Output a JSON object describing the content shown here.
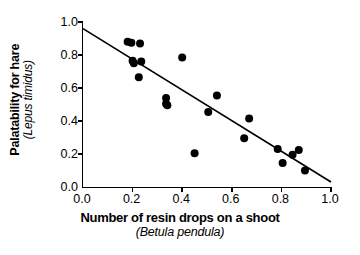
{
  "chart_data": {
    "type": "scatter",
    "title": "",
    "xlabel": "Number of resin drops on a shoot",
    "xlabel_sub": "(Betula pendula)",
    "ylabel": "Palatability for hare",
    "ylabel_sub": "(Lepus timidus)",
    "xlim": [
      0.0,
      1.0
    ],
    "ylim": [
      0.0,
      1.0
    ],
    "grid": false,
    "legend": "none",
    "xticks": [
      "0.0",
      "0.2",
      "0.4",
      "0.6",
      "0.8",
      "1.0"
    ],
    "xtick_values": [
      0.0,
      0.2,
      0.4,
      0.6,
      0.8,
      1.0
    ],
    "yticks": [
      "0.0",
      "0.2",
      "0.4",
      "0.6",
      "0.8",
      "1.0"
    ],
    "ytick_values": [
      0.0,
      0.2,
      0.4,
      0.6,
      0.8,
      1.0
    ],
    "marker": "filled-circle",
    "marker_color": "#000000",
    "marker_size_px": 8,
    "points": [
      {
        "x": 0.18,
        "y": 0.88
      },
      {
        "x": 0.195,
        "y": 0.875
      },
      {
        "x": 0.23,
        "y": 0.87
      },
      {
        "x": 0.2,
        "y": 0.765
      },
      {
        "x": 0.205,
        "y": 0.75
      },
      {
        "x": 0.235,
        "y": 0.76
      },
      {
        "x": 0.225,
        "y": 0.665
      },
      {
        "x": 0.335,
        "y": 0.54
      },
      {
        "x": 0.335,
        "y": 0.505
      },
      {
        "x": 0.34,
        "y": 0.495
      },
      {
        "x": 0.4,
        "y": 0.785
      },
      {
        "x": 0.45,
        "y": 0.205
      },
      {
        "x": 0.505,
        "y": 0.455
      },
      {
        "x": 0.54,
        "y": 0.555
      },
      {
        "x": 0.65,
        "y": 0.295
      },
      {
        "x": 0.67,
        "y": 0.415
      },
      {
        "x": 0.785,
        "y": 0.23
      },
      {
        "x": 0.805,
        "y": 0.145
      },
      {
        "x": 0.845,
        "y": 0.195
      },
      {
        "x": 0.87,
        "y": 0.225
      },
      {
        "x": 0.895,
        "y": 0.1
      }
    ],
    "trendline": {
      "type": "linear-regression",
      "color": "#000000",
      "x_start": 0.0,
      "y_start": 0.96,
      "x_end": 1.0,
      "y_end": 0.03
    }
  }
}
